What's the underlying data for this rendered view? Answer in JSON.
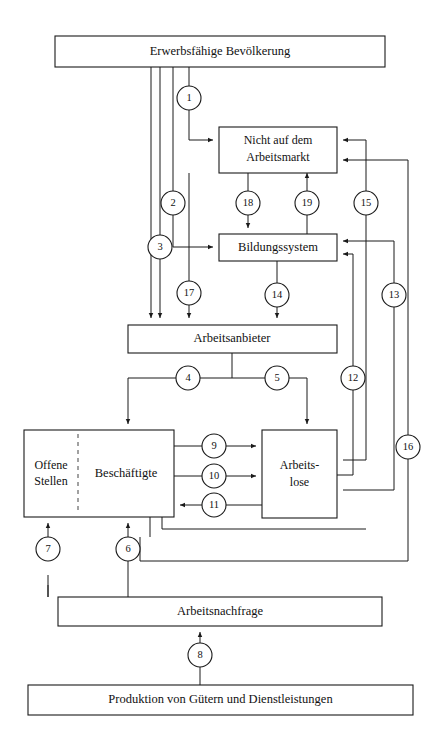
{
  "diagram": {
    "type": "flow-diagram",
    "colors": {
      "background": "#ffffff",
      "stroke": "#1a1a1a",
      "divider": "#555555",
      "text": "#111111"
    },
    "boxes": [
      {
        "id": "erwerbsfaehige-bevoelkerung",
        "label": "Erwerbsfähige Bevölkerung",
        "lines": [
          "Erwerbsfähige Bevölkerung"
        ],
        "x": 55,
        "y": 36,
        "w": 330,
        "h": 31
      },
      {
        "id": "nicht-auf-dem-arbeitsmarkt",
        "label": "Nicht auf dem Arbeitsmarkt",
        "lines": [
          "Nicht auf dem",
          "Arbeitsmarkt"
        ],
        "x": 219,
        "y": 127,
        "w": 118,
        "h": 46
      },
      {
        "id": "bildungssystem",
        "label": "Bildungssystem",
        "lines": [
          "Bildungssystem"
        ],
        "x": 219,
        "y": 234,
        "w": 118,
        "h": 27
      },
      {
        "id": "arbeitsanbieter",
        "label": "Arbeitsanbieter",
        "lines": [
          "Arbeitsanbieter"
        ],
        "x": 128,
        "y": 325,
        "w": 209,
        "h": 28
      },
      {
        "id": "offene-stellen-beschaeftigte",
        "label": "Offene Stellen | Beschäftigte",
        "lines": [],
        "x": 24,
        "y": 430,
        "w": 150,
        "h": 87
      },
      {
        "id": "arbeitslose",
        "label": "Arbeitslose",
        "lines": [
          "Arbeits-",
          "lose"
        ],
        "x": 262,
        "y": 430,
        "w": 75,
        "h": 88
      },
      {
        "id": "arbeitsnachfrage",
        "label": "Arbeitsnachfrage",
        "lines": [
          "Arbeitsnachfrage"
        ],
        "x": 58,
        "y": 597,
        "w": 324,
        "h": 29
      },
      {
        "id": "produktion",
        "label": "Produktion von Gütern und Dienstleistungen",
        "lines": [
          "Produktion von Gütern und Dienstleistungen"
        ],
        "x": 28,
        "y": 685,
        "w": 385,
        "h": 30
      }
    ],
    "sub_labels": {
      "offene_stellen_line1": "Offene",
      "offene_stellen_line2": "Stellen",
      "beschaeftigte": "Beschäftigte",
      "arbeitslose_line1": "Arbeits-",
      "arbeitslose_line2": "lose"
    },
    "flow_nodes": [
      {
        "id": "n1",
        "label": "1",
        "cx": 189,
        "cy": 98,
        "r": 12
      },
      {
        "id": "n2",
        "label": "2",
        "cx": 173,
        "cy": 203,
        "r": 12
      },
      {
        "id": "n3",
        "label": "3",
        "cx": 160,
        "cy": 247,
        "r": 12
      },
      {
        "id": "n4",
        "label": "4",
        "cx": 188,
        "cy": 378,
        "r": 12
      },
      {
        "id": "n5",
        "label": "5",
        "cx": 277,
        "cy": 378,
        "r": 12
      },
      {
        "id": "n6",
        "label": "6",
        "cx": 128,
        "cy": 549,
        "r": 12
      },
      {
        "id": "n7",
        "label": "7",
        "cx": 48,
        "cy": 549,
        "r": 12
      },
      {
        "id": "n8",
        "label": "8",
        "cx": 200,
        "cy": 655,
        "r": 12
      },
      {
        "id": "n9",
        "label": "9",
        "cx": 214,
        "cy": 446,
        "r": 12
      },
      {
        "id": "n10",
        "label": "10",
        "cx": 214,
        "cy": 476,
        "r": 12
      },
      {
        "id": "n11",
        "label": "11",
        "cx": 214,
        "cy": 505,
        "r": 12
      },
      {
        "id": "n12",
        "label": "12",
        "cx": 353,
        "cy": 378,
        "r": 12
      },
      {
        "id": "n13",
        "label": "13",
        "cx": 394,
        "cy": 295,
        "r": 12
      },
      {
        "id": "n14",
        "label": "14",
        "cx": 277,
        "cy": 295,
        "r": 12
      },
      {
        "id": "n15",
        "label": "15",
        "cx": 366,
        "cy": 203,
        "r": 12
      },
      {
        "id": "n16",
        "label": "16",
        "cx": 408,
        "cy": 447,
        "r": 12
      },
      {
        "id": "n17",
        "label": "17",
        "cx": 189,
        "cy": 293,
        "r": 12
      },
      {
        "id": "n18",
        "label": "18",
        "cx": 248,
        "cy": 203,
        "r": 12
      },
      {
        "id": "n19",
        "label": "19",
        "cx": 307,
        "cy": 203,
        "r": 12
      }
    ],
    "flows": [
      {
        "id": "f1",
        "node": "1",
        "from": "erwerbsfähige-bevölkerung",
        "to": "nicht-auf-dem-arbeitsmarkt"
      },
      {
        "id": "f2",
        "node": "2",
        "from": "erwerbsfähige-bevölkerung",
        "to": "bildungssystem"
      },
      {
        "id": "f3",
        "node": "3",
        "from": "erwerbsfähige-bevölkerung",
        "to": "arbeitsanbieter"
      },
      {
        "id": "f4",
        "node": "4",
        "from": "arbeitsanbieter",
        "to": "beschäftigte"
      },
      {
        "id": "f5",
        "node": "5",
        "from": "arbeitsanbieter",
        "to": "arbeitslose"
      },
      {
        "id": "f6",
        "node": "6",
        "from": "arbeitsnachfrage",
        "to": "beschäftigte"
      },
      {
        "id": "f7",
        "node": "7",
        "from": "arbeitsnachfrage",
        "to": "offene-stellen"
      },
      {
        "id": "f8",
        "node": "8",
        "from": "produktion",
        "to": "arbeitsnachfrage"
      },
      {
        "id": "f9",
        "node": "9",
        "from": "beschäftigte",
        "to": "arbeitslose"
      },
      {
        "id": "f10",
        "node": "10",
        "from": "beschäftigte",
        "to": "arbeitslose"
      },
      {
        "id": "f11",
        "node": "11",
        "from": "arbeitslose",
        "to": "beschäftigte"
      },
      {
        "id": "f12",
        "node": "12",
        "from": "arbeitslose",
        "to": "bildungssystem"
      },
      {
        "id": "f13",
        "node": "13",
        "from": "arbeitslose",
        "to": "bildungssystem"
      },
      {
        "id": "f14",
        "node": "14",
        "from": "bildungssystem",
        "to": "arbeitsanbieter"
      },
      {
        "id": "f15",
        "node": "15",
        "from": "nicht-auf-dem-arbeitsmarkt",
        "to": "beschäftigte"
      },
      {
        "id": "f16",
        "node": "16",
        "from": "beschäftigte",
        "to": "nicht-auf-dem-arbeitsmarkt"
      },
      {
        "id": "f17",
        "node": "17",
        "from": "erwerbsfähige-bevölkerung",
        "to": "arbeitsanbieter"
      },
      {
        "id": "f18",
        "node": "18",
        "from": "nicht-auf-dem-arbeitsmarkt",
        "to": "bildungssystem"
      },
      {
        "id": "f19",
        "node": "19",
        "from": "bildungssystem",
        "to": "nicht-auf-dem-arbeitsmarkt"
      }
    ]
  }
}
